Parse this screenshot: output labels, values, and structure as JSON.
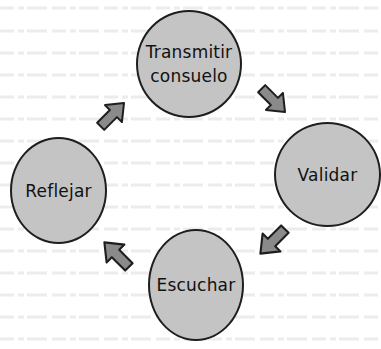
{
  "diagram": {
    "type": "cycle",
    "nodes": [
      {
        "id": "transmitir",
        "label_line1": "Transmitir",
        "label_line2": "consuelo"
      },
      {
        "id": "validar",
        "label": "Validar"
      },
      {
        "id": "escuchar",
        "label": "Escuchar"
      },
      {
        "id": "reflejar",
        "label": "Reflejar"
      }
    ],
    "edges": [
      {
        "from": "transmitir",
        "to": "validar",
        "direction": "down-right"
      },
      {
        "from": "validar",
        "to": "escuchar",
        "direction": "down-left"
      },
      {
        "from": "escuchar",
        "to": "reflejar",
        "direction": "up-left"
      },
      {
        "from": "reflejar",
        "to": "transmitir",
        "direction": "up-right"
      }
    ],
    "colors": {
      "node_fill": "#c4c4c4",
      "node_stroke": "#1e1e1e",
      "arrow_fill": "#8a8a8a",
      "arrow_stroke": "#1e1e1e",
      "text": "#111111",
      "background": "#ffffff"
    }
  }
}
